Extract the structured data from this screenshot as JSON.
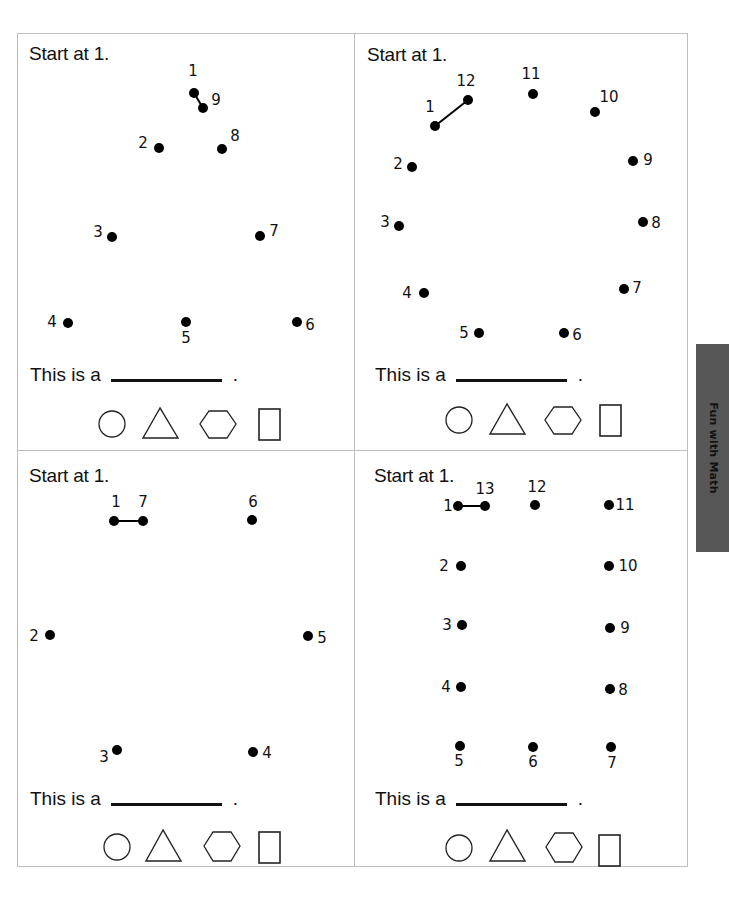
{
  "side_tab": {
    "label": "Fun with Math",
    "color": "#575757"
  },
  "panels": [
    {
      "id": "top-left",
      "instruction": "Start at 1.",
      "sentence": "This is a",
      "period": ".",
      "dots": [
        {
          "n": "1",
          "x": 194,
          "y": 93,
          "lx": 193,
          "ly": 71
        },
        {
          "n": "9",
          "x": 203,
          "y": 108,
          "lx": 216,
          "ly": 100
        },
        {
          "n": "2",
          "x": 159,
          "y": 148,
          "lx": 143,
          "ly": 143
        },
        {
          "n": "8",
          "x": 222,
          "y": 149,
          "lx": 235,
          "ly": 136
        },
        {
          "n": "3",
          "x": 112,
          "y": 237,
          "lx": 98,
          "ly": 232
        },
        {
          "n": "7",
          "x": 260,
          "y": 236,
          "lx": 274,
          "ly": 231
        },
        {
          "n": "4",
          "x": 68,
          "y": 323,
          "lx": 52,
          "ly": 322
        },
        {
          "n": "5",
          "x": 186,
          "y": 322,
          "lx": 186,
          "ly": 338
        },
        {
          "n": "6",
          "x": 297,
          "y": 322,
          "lx": 310,
          "ly": 325
        }
      ],
      "connected": [
        [
          "1",
          "9"
        ]
      ],
      "choices": [
        "circle",
        "triangle",
        "hexagon",
        "rectangle"
      ]
    },
    {
      "id": "top-right",
      "instruction": "Start at 1.",
      "sentence": "This is a",
      "period": ".",
      "dots": [
        {
          "n": "1",
          "x": 435,
          "y": 126,
          "lx": 430,
          "ly": 107
        },
        {
          "n": "12",
          "x": 468,
          "y": 100,
          "lx": 466,
          "ly": 81
        },
        {
          "n": "11",
          "x": 533,
          "y": 94,
          "lx": 531,
          "ly": 74
        },
        {
          "n": "10",
          "x": 595,
          "y": 112,
          "lx": 609,
          "ly": 97
        },
        {
          "n": "2",
          "x": 412,
          "y": 167,
          "lx": 398,
          "ly": 164
        },
        {
          "n": "9",
          "x": 633,
          "y": 161,
          "lx": 648,
          "ly": 160
        },
        {
          "n": "3",
          "x": 399,
          "y": 226,
          "lx": 385,
          "ly": 222
        },
        {
          "n": "8",
          "x": 643,
          "y": 222,
          "lx": 656,
          "ly": 223
        },
        {
          "n": "4",
          "x": 424,
          "y": 293,
          "lx": 407,
          "ly": 293
        },
        {
          "n": "7",
          "x": 624,
          "y": 289,
          "lx": 637,
          "ly": 288
        },
        {
          "n": "5",
          "x": 479,
          "y": 333,
          "lx": 464,
          "ly": 333
        },
        {
          "n": "6",
          "x": 564,
          "y": 333,
          "lx": 577,
          "ly": 335
        }
      ],
      "connected": [
        [
          "1",
          "12"
        ]
      ],
      "choices": [
        "circle",
        "triangle",
        "hexagon",
        "rectangle"
      ]
    },
    {
      "id": "bottom-left",
      "instruction": "Start at 1.",
      "sentence": "This is a",
      "period": ".",
      "dots": [
        {
          "n": "1",
          "x": 114,
          "y": 521,
          "lx": 116,
          "ly": 502
        },
        {
          "n": "7",
          "x": 143,
          "y": 521,
          "lx": 143,
          "ly": 502
        },
        {
          "n": "6",
          "x": 252,
          "y": 520,
          "lx": 253,
          "ly": 502
        },
        {
          "n": "2",
          "x": 50,
          "y": 635,
          "lx": 34,
          "ly": 636
        },
        {
          "n": "5",
          "x": 308,
          "y": 636,
          "lx": 322,
          "ly": 638
        },
        {
          "n": "3",
          "x": 117,
          "y": 750,
          "lx": 104,
          "ly": 757
        },
        {
          "n": "4",
          "x": 253,
          "y": 752,
          "lx": 267,
          "ly": 753
        }
      ],
      "connected": [
        [
          "1",
          "7"
        ]
      ],
      "choices": [
        "circle",
        "triangle",
        "hexagon",
        "rectangle"
      ]
    },
    {
      "id": "bottom-right",
      "instruction": "Start at 1.",
      "sentence": "This is a",
      "period": ".",
      "dots": [
        {
          "n": "1",
          "x": 458,
          "y": 506,
          "lx": 448,
          "ly": 506
        },
        {
          "n": "13",
          "x": 485,
          "y": 506,
          "lx": 485,
          "ly": 489
        },
        {
          "n": "12",
          "x": 535,
          "y": 505,
          "lx": 537,
          "ly": 487
        },
        {
          "n": "11",
          "x": 609,
          "y": 505,
          "lx": 625,
          "ly": 505
        },
        {
          "n": "2",
          "x": 461,
          "y": 566,
          "lx": 444,
          "ly": 566
        },
        {
          "n": "10",
          "x": 609,
          "y": 566,
          "lx": 628,
          "ly": 566
        },
        {
          "n": "3",
          "x": 462,
          "y": 625,
          "lx": 447,
          "ly": 625
        },
        {
          "n": "9",
          "x": 610,
          "y": 628,
          "lx": 625,
          "ly": 628
        },
        {
          "n": "4",
          "x": 461,
          "y": 687,
          "lx": 446,
          "ly": 687
        },
        {
          "n": "8",
          "x": 610,
          "y": 689,
          "lx": 623,
          "ly": 690
        },
        {
          "n": "5",
          "x": 460,
          "y": 746,
          "lx": 459,
          "ly": 761
        },
        {
          "n": "6",
          "x": 533,
          "y": 747,
          "lx": 533,
          "ly": 762
        },
        {
          "n": "7",
          "x": 611,
          "y": 747,
          "lx": 612,
          "ly": 763
        }
      ],
      "connected": [
        [
          "1",
          "13"
        ]
      ],
      "choices": [
        "circle",
        "triangle",
        "hexagon",
        "rectangle"
      ]
    }
  ]
}
